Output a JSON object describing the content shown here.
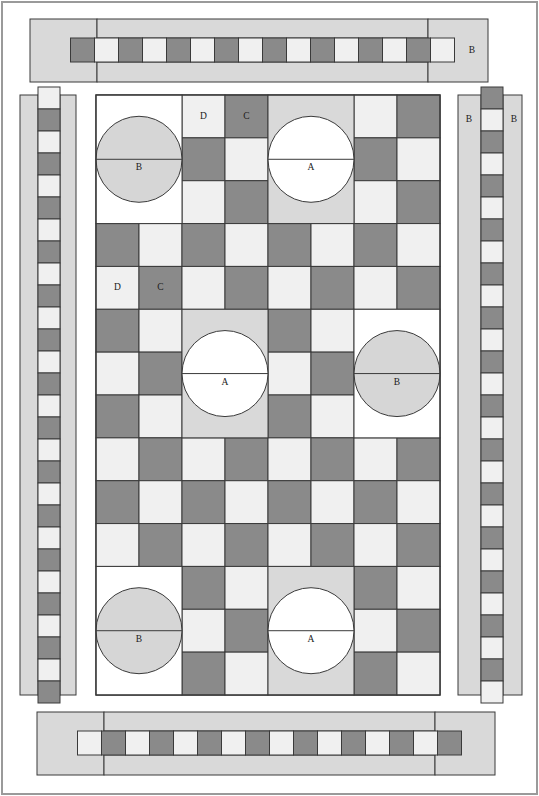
{
  "diagram": {
    "colors": {
      "dark": "#8a8a8a",
      "light": "#f0f0f0",
      "white": "#ffffff",
      "panel": "#d9d9d9",
      "circle_b": "#d6d6d6",
      "circle_a": "#ffffff",
      "stroke": "#3a3a3a",
      "page": "#ffffff"
    },
    "grid": {
      "cols": 8,
      "rows": 14,
      "cell": 43,
      "origin_x": 96,
      "origin_y": 95
    },
    "labels": {
      "a": "A",
      "b": "B",
      "c": "C",
      "d": "D"
    },
    "blocks": [
      {
        "name": "block-b-topleft",
        "label": "B",
        "col": 0,
        "row": 0,
        "w": 2,
        "h": 3,
        "kind": "B"
      },
      {
        "name": "block-a-topmid",
        "label": "A",
        "col": 4,
        "row": 0,
        "w": 2,
        "h": 3,
        "kind": "A"
      },
      {
        "name": "block-a-middle",
        "label": "A",
        "col": 2,
        "row": 5,
        "w": 2,
        "h": 3,
        "kind": "A"
      },
      {
        "name": "block-b-midright",
        "label": "B",
        "col": 6,
        "row": 5,
        "w": 2,
        "h": 3,
        "kind": "B"
      },
      {
        "name": "block-b-bottom",
        "label": "B",
        "col": 0,
        "row": 11,
        "w": 2,
        "h": 3,
        "kind": "B"
      },
      {
        "name": "block-a-bottom",
        "label": "A",
        "col": 4,
        "row": 11,
        "w": 2,
        "h": 3,
        "kind": "A"
      }
    ],
    "cell_labels": [
      {
        "name": "cell-label-d-top",
        "text": "D",
        "col": 2,
        "row": 0
      },
      {
        "name": "cell-label-c-top",
        "text": "C",
        "col": 3,
        "row": 0
      },
      {
        "name": "cell-label-d-mid",
        "text": "D",
        "col": 0,
        "row": 4
      },
      {
        "name": "cell-label-c-mid",
        "text": "C",
        "col": 1,
        "row": 4
      }
    ],
    "top_border": {
      "name": "top-border-panel",
      "x": 30,
      "y": 19,
      "w": 458,
      "h": 63,
      "left_cap_w": 67,
      "right_cap_x": 428,
      "strip_y": 38,
      "strip_h": 24,
      "squares": 16,
      "first_color": "dark",
      "label": "B",
      "label_x": 472,
      "label_y": 51
    },
    "bottom_border": {
      "name": "bottom-border-panel",
      "x": 37,
      "y": 712,
      "w": 458,
      "h": 63,
      "left_cap_w": 67,
      "right_cap_x": 435,
      "strip_y": 731,
      "strip_h": 24,
      "squares": 16,
      "first_color": "light"
    },
    "left_panel": {
      "name": "left-side-panel",
      "x": 20,
      "y": 95,
      "w": 56,
      "h": 600,
      "strip_x": 38,
      "strip_w": 22,
      "squares": 28,
      "first_color": "light"
    },
    "right_panel": {
      "name": "right-side-panel",
      "x": 458,
      "y": 95,
      "w": 64,
      "h": 600,
      "strip_x": 481,
      "strip_w": 22,
      "squares": 28,
      "first_color": "dark",
      "label_left": "B",
      "label_right": "B",
      "label_y": 120,
      "label_left_x": 469,
      "label_right_x": 514
    },
    "main_panel": {
      "name": "main-grid-panel",
      "x": 96,
      "y": 95,
      "w": 344,
      "h": 600
    },
    "outer_frame": {
      "name": "outer-frame",
      "x": 2,
      "y": 2,
      "w": 535,
      "h": 792
    }
  }
}
